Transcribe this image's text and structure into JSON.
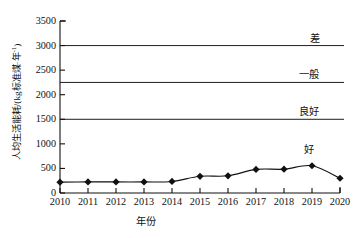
{
  "chart_data": {
    "type": "line",
    "title": "",
    "xlabel": "年份",
    "ylabel": "人均生活能耗/(kg标准煤·年",
    "ylabel_exponent": "-1",
    "ylabel_tail": ")",
    "x": [
      2010,
      2011,
      2012,
      2013,
      2014,
      2015,
      2016,
      2017,
      2018,
      2019,
      2020
    ],
    "xtick_labels": [
      "2010",
      "2011",
      "2012",
      "2013",
      "2014",
      "2015",
      "2016",
      "2017",
      "2018",
      "2019",
      "2020"
    ],
    "values": [
      220,
      225,
      225,
      225,
      235,
      340,
      350,
      480,
      485,
      555,
      300
    ],
    "ylim": [
      0,
      3500
    ],
    "xlim": [
      2010,
      2020
    ],
    "ytick_labels": [
      "0",
      "500",
      "1000",
      "1500",
      "2000",
      "2500",
      "3000",
      "3500"
    ],
    "yticks": [
      0,
      500,
      1000,
      1500,
      2000,
      2500,
      3000,
      3500
    ],
    "grid": false,
    "legend": "none",
    "marker": "diamond",
    "line_color": "#111111",
    "marker_color": "#111111",
    "threshold_lines": [
      {
        "value": 3000,
        "label": "差",
        "label_x": 2019.1
      },
      {
        "value": 2250,
        "label": "一般",
        "label_x": 2018.9
      },
      {
        "value": 1500,
        "label": "良好",
        "label_x": 2018.9
      },
      {
        "value": 0,
        "label": "好",
        "label_x": 2018.9,
        "label_value": 900,
        "is_line": false
      }
    ],
    "annotations": [
      {
        "text": "差",
        "value": 3150
      },
      {
        "text": "一般",
        "value": 2420
      },
      {
        "text": "良好",
        "value": 1670
      },
      {
        "text": "好",
        "value": 900
      }
    ]
  }
}
